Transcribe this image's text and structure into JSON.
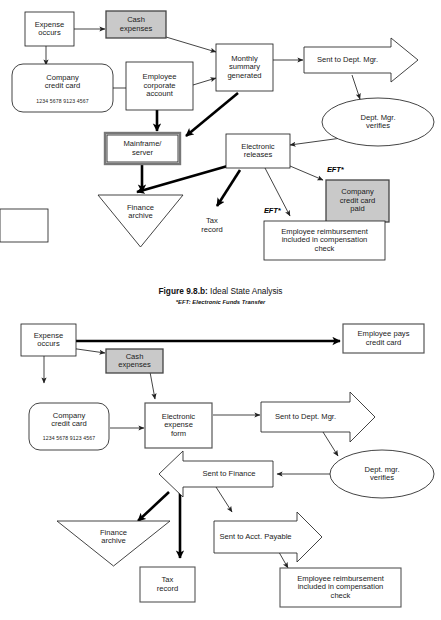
{
  "figure": {
    "caption_label": "Figure 9.8.b:",
    "caption_title": "Ideal State Analysis",
    "footnote": "*EFT: Electronic Funds Transfer"
  },
  "colors": {
    "shaded_fill": "#c9c9c9",
    "stroke": "#222222",
    "thick_stroke": "#000000",
    "page_bg": "#ffffff"
  },
  "top_diagram": {
    "name": "Ideal State Analysis flowchart",
    "nodes": [
      {
        "id": "expense-occurs",
        "label": "Expense\noccurs",
        "shape": "rect"
      },
      {
        "id": "cash-expenses",
        "label": "Cash\nexpenses",
        "shape": "rect-shaded"
      },
      {
        "id": "company-credit-card",
        "label": "Company\ncredit card",
        "shape": "rounded-rect",
        "sub": "1234 5678 9123 4567"
      },
      {
        "id": "employee-corporate-account",
        "label": "Employee\ncorporate\naccount",
        "shape": "rect"
      },
      {
        "id": "monthly-summary-generated",
        "label": "Monthly\nsummary\ngenerated",
        "shape": "rect"
      },
      {
        "id": "sent-to-dept-mgr",
        "label": "Sent to Dept. Mgr.",
        "shape": "block-arrow-right"
      },
      {
        "id": "dept-mgr-verifies",
        "label": "Dept. Mgr.\nverifies",
        "shape": "ellipse"
      },
      {
        "id": "mainframe-server",
        "label": "Mainframe/\nserver",
        "shape": "rect-double"
      },
      {
        "id": "electronic-releases",
        "label": "Electronic\nreleases",
        "shape": "rect"
      },
      {
        "id": "finance-archive",
        "label": "Finance\narchive",
        "shape": "triangle-down"
      },
      {
        "id": "tax-record",
        "label": "Tax\nrecord",
        "shape": "rect"
      },
      {
        "id": "company-credit-card-paid",
        "label": "Company\ncredit card\npaid",
        "shape": "rect-shaded"
      },
      {
        "id": "employee-reimbursement",
        "label": "Employee reimbursement\nincluded in compensation\ncheck",
        "shape": "rect"
      }
    ],
    "annotations": [
      {
        "id": "eft-credit-card",
        "label": "EFT*"
      },
      {
        "id": "eft-reimbursement",
        "label": "EFT*"
      }
    ],
    "edges": [
      {
        "from": "expense-occurs",
        "to": "cash-expenses",
        "weight": "thin"
      },
      {
        "from": "expense-occurs",
        "to": "company-credit-card",
        "weight": "thin"
      },
      {
        "from": "cash-expenses",
        "to": "monthly-summary-generated",
        "weight": "thin"
      },
      {
        "from": "company-credit-card",
        "to": "employee-corporate-account",
        "weight": "thin"
      },
      {
        "from": "employee-corporate-account",
        "to": "monthly-summary-generated",
        "weight": "thin"
      },
      {
        "from": "employee-corporate-account",
        "to": "mainframe-server",
        "weight": "thick"
      },
      {
        "from": "monthly-summary-generated",
        "to": "sent-to-dept-mgr",
        "weight": "thin"
      },
      {
        "from": "monthly-summary-generated",
        "to": "mainframe-server",
        "weight": "thick"
      },
      {
        "from": "monthly-summary-generated",
        "to": "finance-archive",
        "weight": "thick"
      },
      {
        "from": "sent-to-dept-mgr",
        "to": "dept-mgr-verifies",
        "weight": "thin"
      },
      {
        "from": "dept-mgr-verifies",
        "to": "electronic-releases",
        "weight": "thin"
      },
      {
        "from": "mainframe-server",
        "to": "finance-archive",
        "weight": "thick"
      },
      {
        "from": "electronic-releases",
        "to": "finance-archive",
        "weight": "thick"
      },
      {
        "from": "electronic-releases",
        "to": "tax-record",
        "weight": "thick"
      },
      {
        "from": "electronic-releases",
        "to": "company-credit-card-paid",
        "weight": "thin"
      },
      {
        "from": "electronic-releases",
        "to": "employee-reimbursement",
        "weight": "thin"
      }
    ]
  },
  "bottom_diagram": {
    "name": "Current State Analysis flowchart",
    "nodes": [
      {
        "id": "expense-occurs-2",
        "label": "Expense\noccurs",
        "shape": "rect"
      },
      {
        "id": "cash-expenses-2",
        "label": "Cash\nexpenses",
        "shape": "rect-shaded"
      },
      {
        "id": "employee-pays-credit-card",
        "label": "Employee pays\ncredit card",
        "shape": "rect"
      },
      {
        "id": "company-credit-card-2",
        "label": "Company\ncredit card",
        "shape": "rounded-rect",
        "sub": "1234 5678 9123 4567"
      },
      {
        "id": "electronic-expense-form",
        "label": "Electronic\nexpense\nform",
        "shape": "rect"
      },
      {
        "id": "sent-to-dept-mgr-2",
        "label": "Sent to Dept. Mgr.",
        "shape": "block-arrow-right"
      },
      {
        "id": "dept-mgr-verifies-2",
        "label": "Dept. mgr.\nverifies",
        "shape": "ellipse"
      },
      {
        "id": "sent-to-finance",
        "label": "Sent to Finance",
        "shape": "block-arrow-left"
      },
      {
        "id": "sent-to-acct-payable",
        "label": "Sent to Acct. Payable",
        "shape": "block-arrow-right"
      },
      {
        "id": "finance-archive-2",
        "label": "Finance\narchive",
        "shape": "triangle-down"
      },
      {
        "id": "tax-record-2",
        "label": "Tax\nrecord",
        "shape": "rect"
      },
      {
        "id": "employee-reimbursement-2",
        "label": "Employee reimbursement\nincluded in compensation\ncheck",
        "shape": "rect"
      }
    ],
    "edges": [
      {
        "from": "expense-occurs-2",
        "to": "employee-pays-credit-card",
        "weight": "thick"
      },
      {
        "from": "expense-occurs-2",
        "to": "cash-expenses-2",
        "weight": "thin"
      },
      {
        "from": "expense-occurs-2",
        "to": "company-credit-card-2",
        "weight": "thin"
      },
      {
        "from": "cash-expenses-2",
        "to": "electronic-expense-form",
        "weight": "thin"
      },
      {
        "from": "company-credit-card-2",
        "to": "electronic-expense-form",
        "weight": "thin"
      },
      {
        "from": "electronic-expense-form",
        "to": "sent-to-dept-mgr-2",
        "weight": "thin"
      },
      {
        "from": "sent-to-dept-mgr-2",
        "to": "dept-mgr-verifies-2",
        "weight": "thin"
      },
      {
        "from": "dept-mgr-verifies-2",
        "to": "sent-to-finance",
        "weight": "thin"
      },
      {
        "from": "sent-to-finance",
        "to": "finance-archive-2",
        "weight": "thick"
      },
      {
        "from": "sent-to-finance",
        "to": "tax-record-2",
        "weight": "thick"
      },
      {
        "from": "sent-to-finance",
        "to": "sent-to-acct-payable",
        "weight": "thin"
      },
      {
        "from": "sent-to-acct-payable",
        "to": "employee-reimbursement-2",
        "weight": "thin"
      }
    ]
  }
}
